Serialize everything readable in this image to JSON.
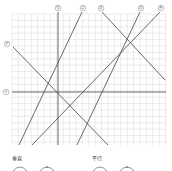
{
  "diagram": {
    "grid": {
      "x0": 12,
      "y0": 14,
      "x1": 166,
      "y1": 145,
      "step": 6.4,
      "color": "#d9d9d9"
    },
    "lines": [
      {
        "id": "a",
        "label": "ア",
        "x1": 13,
        "y1": 47,
        "x2": 108,
        "y2": 145,
        "lx": 7,
        "ly": 44
      },
      {
        "id": "i",
        "label": "イ",
        "x1": 12,
        "y1": 92,
        "x2": 166,
        "y2": 92,
        "lx": 6,
        "ly": 92
      },
      {
        "id": "u",
        "label": "ウ",
        "x1": 58,
        "y1": 12,
        "x2": 58,
        "y2": 145,
        "lx": 58,
        "ly": 8
      },
      {
        "id": "e",
        "label": "エ",
        "x1": 82,
        "y1": 12,
        "x2": 19,
        "y2": 145,
        "lx": 83,
        "ly": 8
      },
      {
        "id": "o",
        "label": "オ",
        "x1": 102,
        "y1": 12,
        "x2": 165,
        "y2": 80,
        "lx": 101,
        "ly": 8
      },
      {
        "id": "ka",
        "label": "カ",
        "x1": 140,
        "y1": 12,
        "x2": 77,
        "y2": 145,
        "lx": 141,
        "ly": 8
      },
      {
        "id": "ki",
        "label": "キ",
        "x1": 160,
        "y1": 12,
        "x2": 32,
        "y2": 145,
        "lx": 161,
        "ly": 8
      }
    ],
    "line_color": "#444444"
  },
  "legend": {
    "perpendicular": {
      "label": "垂直"
    },
    "parallel": {
      "label": "平行"
    }
  }
}
